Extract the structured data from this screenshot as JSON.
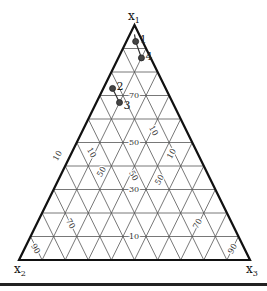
{
  "diagram": {
    "type": "ternary",
    "vertices": {
      "top": {
        "label": "x",
        "sub": "1"
      },
      "left": {
        "label": "x",
        "sub": "2"
      },
      "right": {
        "label": "x",
        "sub": "3"
      }
    },
    "horizontal_labels": [
      "70",
      "50",
      "30",
      "10"
    ],
    "left_rotated_labels": [
      "10",
      "50",
      "70",
      "90"
    ],
    "right_rotated_labels": [
      "10",
      "50",
      "70",
      "90"
    ],
    "colors": {
      "frame": "#111111",
      "grid": "#555555",
      "point": "#444444"
    },
    "points": [
      {
        "id": "1",
        "x1": 0.93,
        "x2": 0.03,
        "x3": 0.04
      },
      {
        "id": "4",
        "x1": 0.86,
        "x2": 0.04,
        "x3": 0.1
      },
      {
        "id": "2",
        "x1": 0.73,
        "x2": 0.23,
        "x3": 0.04
      },
      {
        "id": "3",
        "x1": 0.67,
        "x2": 0.23,
        "x3": 0.1
      }
    ]
  }
}
